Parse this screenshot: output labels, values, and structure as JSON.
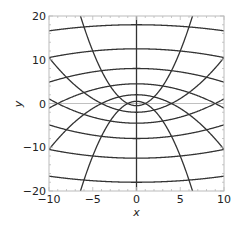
{
  "chart_data": {
    "type": "line",
    "title": "",
    "xlabel": "x",
    "ylabel": "y",
    "xlim": [
      -10,
      10
    ],
    "ylim": [
      -20,
      20
    ],
    "xticks": [
      -10,
      -5,
      0,
      5,
      10
    ],
    "yticks": [
      -20,
      -10,
      0,
      10,
      20
    ],
    "xtick_labels": [
      "−10",
      "−5",
      "0",
      "5",
      "10"
    ],
    "ytick_labels": [
      "−20",
      "−10",
      "0",
      "10",
      "20"
    ],
    "grid": false,
    "legend": null,
    "series": [
      {
        "name": "sigma (opening up): y = x^2/(2 s^2) - s^2/2",
        "values": [
          1,
          2,
          3,
          4,
          5,
          6
        ]
      },
      {
        "name": "tau (opening down): y = t^2/2 - x^2/(2 t^2)",
        "values": [
          1,
          2,
          3,
          4,
          5,
          6
        ]
      },
      {
        "name": "x = 0 line",
        "values": [
          0
        ]
      }
    ],
    "axis_crossings_at_x0": [
      -18,
      -12.5,
      -8,
      -4.5,
      -2,
      -0.5,
      0.5,
      2,
      4.5,
      8,
      12.5,
      18
    ],
    "reference_line": {
      "y": 0,
      "color": "#b0b0b0"
    },
    "curve_color": "#333333"
  }
}
